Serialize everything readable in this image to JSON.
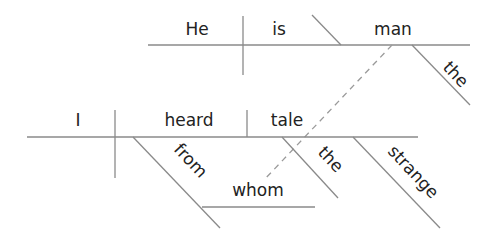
{
  "diagram": {
    "type": "sentence-diagram (Reed-Kellogg)",
    "main_clause": {
      "subject": "I",
      "verb": "heard",
      "direct_object": "tale",
      "object_modifiers": [
        "the",
        "strange"
      ],
      "prepositional_phrase": {
        "preposition": "from",
        "object": "whom"
      }
    },
    "relative_clause": {
      "subject": "He",
      "verb": "is",
      "predicate_nominative": "man",
      "modifiers": [
        "the"
      ]
    },
    "connector": {
      "from": "whom",
      "to": "man",
      "style": "dashed"
    }
  },
  "words": {
    "he": "He",
    "is": "is",
    "man": "man",
    "the_top": "the",
    "i": "I",
    "heard": "heard",
    "tale": "tale",
    "from": "from",
    "whom": "whom",
    "the_bottom": "the",
    "strange": "strange"
  }
}
